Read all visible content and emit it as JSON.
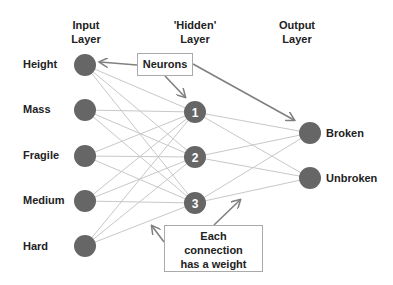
{
  "headers": {
    "input": [
      "Input",
      "Layer"
    ],
    "hidden": [
      "'Hidden'",
      "Layer"
    ],
    "output": [
      "Output",
      "Layer"
    ]
  },
  "input_nodes": [
    {
      "label": "Height",
      "x": 85,
      "y": 65
    },
    {
      "label": "Mass",
      "x": 85,
      "y": 110
    },
    {
      "label": "Fragile",
      "x": 85,
      "y": 156
    },
    {
      "label": "Medium",
      "x": 85,
      "y": 201
    },
    {
      "label": "Hard",
      "x": 85,
      "y": 246
    }
  ],
  "hidden_nodes": [
    {
      "label": "1",
      "x": 195,
      "y": 112
    },
    {
      "label": "2",
      "x": 195,
      "y": 157
    },
    {
      "label": "3",
      "x": 195,
      "y": 203
    }
  ],
  "output_nodes": [
    {
      "label": "Broken",
      "x": 310,
      "y": 133
    },
    {
      "label": "Unbroken",
      "x": 310,
      "y": 178
    }
  ],
  "callouts": {
    "neurons": "Neurons",
    "weight": [
      "Each",
      "connection",
      "has a weight"
    ]
  },
  "colors": {
    "node": "#666666",
    "edge": "#c8c8c8",
    "arrow": "#808080"
  }
}
